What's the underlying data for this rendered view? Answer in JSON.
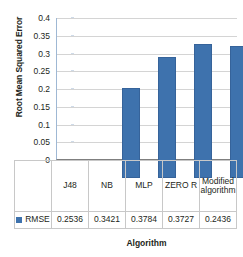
{
  "chart_data": {
    "type": "bar",
    "title": "",
    "xlabel": "Algorithm",
    "ylabel": "Root Mean Squared Error",
    "categories": [
      "J48",
      "NB",
      "MLP",
      "ZERO R",
      "Modified algorithm"
    ],
    "series": [
      {
        "name": "RMSE",
        "values": [
          0.2536,
          0.3421,
          0.3784,
          0.3727,
          0.2436
        ],
        "color": "#3e72ad"
      }
    ],
    "value_labels": [
      "0.2536",
      "0.3421",
      "0.3784",
      "0.3727",
      "0.2436"
    ],
    "ylim": [
      0,
      0.4
    ],
    "ytick_labels": [
      "0.4",
      "0.35",
      "0.3",
      "0.25",
      "0.2",
      "0.15",
      "0.1",
      "0.05",
      "0"
    ],
    "ytick_values": [
      0.4,
      0.35,
      0.3,
      0.25,
      0.2,
      0.15,
      0.1,
      0.05,
      0
    ],
    "grid": true,
    "grid_axis": "y",
    "legend": {
      "position": "bottom-table",
      "entries": [
        {
          "label": "RMSE",
          "swatch": "legend-swatch-rmse",
          "color": "#3e72ad"
        }
      ]
    }
  },
  "colors": {
    "bar_fill": "#3e72ad",
    "bar_stroke": "#36639a",
    "gridline": "#d4d4d4",
    "axis_line": "#7f7f7f",
    "table_border": "#c8c8c8",
    "text": "#231f20",
    "background": "#ffffff"
  }
}
